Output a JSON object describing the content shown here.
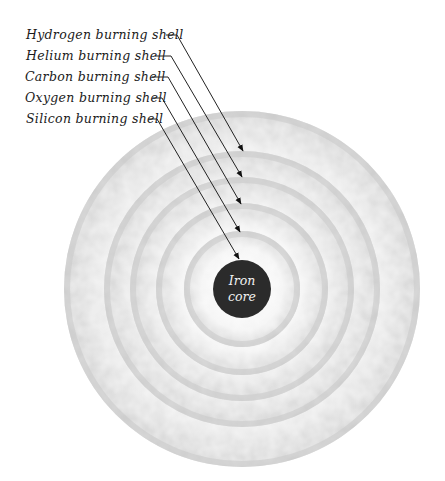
{
  "diagram": {
    "center": {
      "x": 242,
      "y": 289
    },
    "core": {
      "label_line1": "Iron",
      "label_line2": "core",
      "radius": 29,
      "color": "#2b2b2b"
    },
    "shells": [
      {
        "name": "Hydrogen burning shell",
        "outer_radius": 178,
        "inner_radius": 139,
        "label_y": 39,
        "line_start_x": 166,
        "line_knee_x": 177,
        "line_y": 35,
        "tip": {
          "x": 243,
          "y": 151
        }
      },
      {
        "name": "Helium burning shell",
        "outer_radius": 138,
        "inner_radius": 113,
        "label_y": 60,
        "line_start_x": 155,
        "line_knee_x": 171,
        "line_y": 56,
        "tip": {
          "x": 242,
          "y": 177
        }
      },
      {
        "name": "Carbon burning shell",
        "outer_radius": 112,
        "inner_radius": 87,
        "label_y": 81,
        "line_start_x": 152,
        "line_knee_x": 168,
        "line_y": 77,
        "tip": {
          "x": 241,
          "y": 204
        }
      },
      {
        "name": "Oxygen burning shell",
        "outer_radius": 86,
        "inner_radius": 59,
        "label_y": 102,
        "line_start_x": 153,
        "line_knee_x": 162,
        "line_y": 98,
        "tip": {
          "x": 240,
          "y": 232
        }
      },
      {
        "name": "Silicon burning shell",
        "outer_radius": 58,
        "inner_radius": 30,
        "label_y": 123,
        "line_start_x": 149,
        "line_knee_x": 157,
        "line_y": 119,
        "tip": {
          "x": 239,
          "y": 259
        }
      }
    ],
    "colors": {
      "shell_fill": "#d6d6d6",
      "shell_highlight": "#f4f4f4",
      "gap": "#ffffff",
      "leader_line": "#222222",
      "label_text": "#1a1a1a"
    }
  }
}
